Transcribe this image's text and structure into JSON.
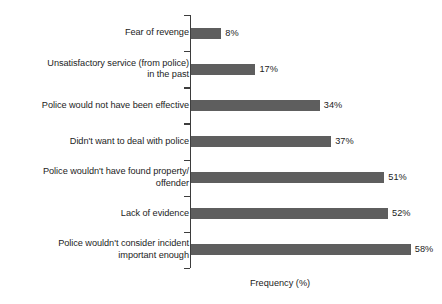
{
  "chart": {
    "type": "bar",
    "orientation": "horizontal",
    "xlabel": "Frequency (%)",
    "ylabel": "",
    "title": "",
    "bar_color": "#5e5e5e",
    "axis_color": "#3d3d3d",
    "text_color": "#1c1c1c"
  },
  "chart_data": {
    "type": "bar",
    "orientation": "horizontal",
    "title": "",
    "xlabel": "Frequency (%)",
    "ylabel": "",
    "xlim": [
      0,
      65
    ],
    "grid": false,
    "legend": false,
    "value_suffix": "%",
    "categories": [
      "Fear of revenge",
      "Unsatisfactory service (from police)\nin the past",
      "Police would not have been effective",
      "Didn't want to deal with police",
      "Police wouldn't have found property/\noffender",
      "Lack of evidence",
      "Police wouldn't consider incident\nimportant enough"
    ],
    "values": [
      8,
      17,
      34,
      37,
      51,
      52,
      58
    ],
    "value_labels": [
      "8%",
      "17%",
      "34%",
      "37%",
      "51%",
      "52%",
      "58%"
    ]
  },
  "rows": [
    {
      "label": "Fear of revenge",
      "value": 8,
      "value_label": "8%"
    },
    {
      "label": "Unsatisfactory service (from police)\nin the past",
      "value": 17,
      "value_label": "17%"
    },
    {
      "label": "Police would not have been effective",
      "value": 34,
      "value_label": "34%"
    },
    {
      "label": "Didn't want to deal with police",
      "value": 37,
      "value_label": "37%"
    },
    {
      "label": "Police wouldn't have found property/\noffender",
      "value": 51,
      "value_label": "51%"
    },
    {
      "label": "Lack of evidence",
      "value": 52,
      "value_label": "52%"
    },
    {
      "label": "Police wouldn't consider incident\nimportant enough",
      "value": 58,
      "value_label": "58%"
    }
  ]
}
